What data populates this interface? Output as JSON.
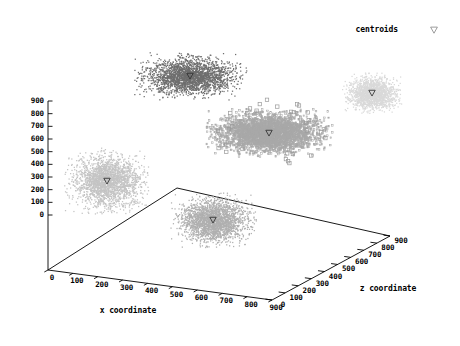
{
  "figure": {
    "type": "3d-scatter",
    "background": "#ffffff",
    "axis_color": "#000000",
    "text_color": "#000000"
  },
  "legend": {
    "label": "centroids",
    "marker": "down-triangle-open",
    "x": 398,
    "y": 30,
    "marker_x": 434,
    "marker_y": 30
  },
  "axes": {
    "x": {
      "title": "x coordinate",
      "title_x": 128,
      "title_y": 311,
      "ticks": [
        0,
        100,
        200,
        300,
        400,
        500,
        600,
        700,
        800,
        900
      ]
    },
    "y": {
      "title": "",
      "ticks": [
        0,
        100,
        200,
        300,
        400,
        500,
        600,
        700,
        800,
        900
      ]
    },
    "z": {
      "title": "z coordinate",
      "title_x": 388,
      "title_y": 289,
      "ticks": [
        0,
        100,
        200,
        300,
        400,
        500,
        600,
        700,
        800,
        900
      ]
    }
  },
  "projection": {
    "origin": [
      48,
      270
    ],
    "x_end": [
      272,
      300
    ],
    "z_end": [
      390,
      236
    ],
    "back_corner": [
      177,
      188
    ],
    "y_top": [
      48,
      101
    ],
    "y_zero": [
      48,
      215
    ]
  },
  "chart_data": {
    "type": "scatter",
    "title": "",
    "xlabel": "x coordinate",
    "ylabel": "",
    "zlabel": "z coordinate",
    "xlim": [
      0,
      900
    ],
    "ylim": [
      0,
      900
    ],
    "zlim": [
      0,
      900
    ],
    "grid": false,
    "legend_position": "top-right",
    "legend_entries": [
      "centroids"
    ],
    "series": [
      {
        "name": "cluster-1",
        "color": "#6e6e6e",
        "marker": "dot",
        "n_points": 2400,
        "centroid": [
          190,
          76
        ],
        "spread": [
          52,
          22
        ],
        "centroid_marker": "down-triangle"
      },
      {
        "name": "cluster-2",
        "color": "#a8a8a8",
        "marker": "square-open",
        "n_points": 2600,
        "centroid": [
          269,
          133
        ],
        "spread": [
          58,
          22
        ],
        "centroid_marker": "down-triangle"
      },
      {
        "name": "cluster-3",
        "color": "#d9d9d9",
        "marker": "dot",
        "n_points": 1700,
        "centroid": [
          372,
          93
        ],
        "spread": [
          28,
          19
        ],
        "centroid_marker": "down-triangle"
      },
      {
        "name": "cluster-4",
        "color": "#c4c4c4",
        "marker": "dot",
        "n_points": 2300,
        "centroid": [
          107,
          181
        ],
        "spread": [
          40,
          31
        ],
        "centroid_marker": "down-triangle"
      },
      {
        "name": "cluster-5",
        "color": "#b0b0b0",
        "marker": "dot",
        "n_points": 2300,
        "centroid": [
          213,
          220
        ],
        "spread": [
          40,
          26
        ],
        "centroid_marker": "down-triangle"
      }
    ]
  }
}
